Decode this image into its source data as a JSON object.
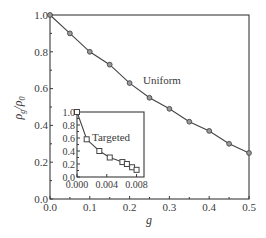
{
  "chart_data": [
    {
      "id": "main",
      "type": "line",
      "title": "",
      "xlabel": "g",
      "ylabel": "ρg/ρ0",
      "ylabel_main": "ρ",
      "ylabel_sub1": "g",
      "ylabel_slash": "/ρ",
      "ylabel_sub2": "0",
      "xlim": [
        0.0,
        0.5
      ],
      "ylim": [
        0.0,
        1.0
      ],
      "xticks": [
        "0.0",
        "0.1",
        "0.2",
        "0.3",
        "0.4",
        "0.5"
      ],
      "yticks": [
        "0.0",
        "0.2",
        "0.4",
        "0.6",
        "0.8",
        "1.0"
      ],
      "grid": false,
      "marker": "circle",
      "series": [
        {
          "name": "Uniform",
          "x": [
            0.0,
            0.05,
            0.1,
            0.15,
            0.2,
            0.25,
            0.3,
            0.35,
            0.4,
            0.45,
            0.5
          ],
          "values": [
            1.0,
            0.9,
            0.8,
            0.73,
            0.63,
            0.55,
            0.49,
            0.42,
            0.37,
            0.3,
            0.25
          ]
        }
      ],
      "annotations": [
        {
          "text": "Uniform",
          "x": 0.23,
          "y": 0.63
        }
      ]
    },
    {
      "id": "inset",
      "type": "line",
      "title": "",
      "xlabel": "",
      "ylabel": "",
      "xlim": [
        0.0,
        0.009
      ],
      "ylim": [
        0.0,
        1.0
      ],
      "xticks": [
        "0.000",
        "0.004",
        "0.008"
      ],
      "yticks": [
        "0.0",
        "0.2",
        "0.4",
        "0.6",
        "0.8",
        "1.0"
      ],
      "grid": false,
      "marker": "square",
      "series": [
        {
          "name": "Targeted",
          "x": [
            0.0,
            0.0013,
            0.003,
            0.0044,
            0.0061,
            0.0067,
            0.0074,
            0.008
          ],
          "values": [
            1.0,
            0.58,
            0.4,
            0.3,
            0.23,
            0.2,
            0.15,
            0.11
          ]
        }
      ],
      "annotations": [
        {
          "text": "Targeted",
          "x": 0.0015,
          "y": 0.6
        }
      ]
    }
  ],
  "colors": {
    "axis": "#3a3a3a",
    "line": "#444444",
    "marker_fill": "#9a9a9a"
  }
}
